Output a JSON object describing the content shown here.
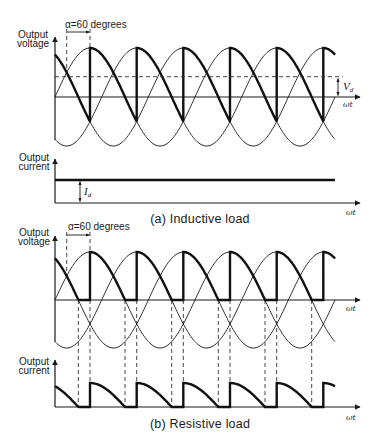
{
  "panel_a": {
    "caption": "(a) Inductive load",
    "voltage_axis_label": [
      "Output",
      "voltage"
    ],
    "current_axis_label": [
      "Output",
      "current"
    ],
    "alpha_label": "α=60 degrees",
    "time_axis_label_voltage": "ωt",
    "time_axis_label_current": "ωt",
    "average_voltage_label": {
      "main": "V",
      "sub": "d"
    },
    "dc_current_label": {
      "main": "I",
      "sub": "d"
    },
    "load": "inductive"
  },
  "panel_b": {
    "caption": "(b) Resistive load",
    "voltage_axis_label": [
      "Output",
      "voltage"
    ],
    "current_axis_label": [
      "Output",
      "current"
    ],
    "alpha_label": "α=60 degrees",
    "time_axis_label_voltage": "ωt",
    "time_axis_label_current": "ωt",
    "load": "resistive"
  },
  "waveforms": {
    "type": "line",
    "firing_angle_deg": 60,
    "phase_count": 3,
    "phase_shift_deg": 120,
    "series": [
      {
        "name": "phase voltages",
        "style": "thin",
        "shape": "sinusoid"
      },
      {
        "name": "output voltage (inductive)",
        "style": "thick",
        "shape": "phase segment from firing, 120 deg each, dips below zero"
      },
      {
        "name": "output current (inductive)",
        "style": "thick",
        "shape": "constant level Id"
      },
      {
        "name": "output voltage (resistive)",
        "style": "thick",
        "shape": "phase segment from firing, clamped at zero"
      },
      {
        "name": "output current (resistive)",
        "style": "thick",
        "shape": "same shape as resistive output voltage"
      }
    ]
  }
}
